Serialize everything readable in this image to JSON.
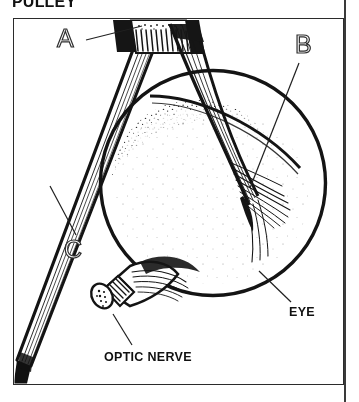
{
  "page": {
    "heading": "PULLEY",
    "width": 359,
    "height": 402,
    "background_color": "#ffffff",
    "ink_color": "#1a1a1a"
  },
  "figure": {
    "type": "anatomical-line-drawing",
    "frame": {
      "stroke_color": "#2b2b2b",
      "x": 13,
      "y": 18,
      "width": 331,
      "height": 367
    },
    "callout_labels": [
      {
        "id": "A",
        "text": "A",
        "style": "outline-letter",
        "x": 57,
        "y": 26,
        "leader_from": [
          88,
          41
        ],
        "leader_to": [
          140,
          28
        ],
        "points_to": "trochlea-pulley"
      },
      {
        "id": "B",
        "text": "B",
        "style": "outline-letter",
        "x": 295,
        "y": 32,
        "leader_from": [
          300,
          62
        ],
        "leader_to": [
          248,
          186
        ],
        "points_to": "tendon-insertion-fibers"
      },
      {
        "id": "C",
        "text": "C",
        "style": "outline-letter",
        "x": 64,
        "y": 237,
        "leader_from": [
          74,
          236
        ],
        "leader_to": [
          50,
          186
        ],
        "points_to": "superior-oblique-muscle-belly"
      }
    ],
    "text_labels": [
      {
        "id": "eye",
        "text": "EYE",
        "style": "bold-caption",
        "x": 289,
        "y": 305,
        "leader_from": [
          288,
          303
        ],
        "leader_to": [
          258,
          272
        ],
        "points_to": "eyeball-sclera"
      },
      {
        "id": "optic-nerve",
        "text": "OPTIC NERVE",
        "style": "bold-caption",
        "x": 104,
        "y": 350,
        "leader_from": [
          131,
          346
        ],
        "leader_to": [
          113,
          314
        ],
        "points_to": "optic-nerve-stump"
      }
    ],
    "parts": {
      "eyeball": {
        "name": "eyeball",
        "shape": "circle",
        "center_x": 213,
        "center_y": 183,
        "radius": 113,
        "shading": "stipple-rim-dark-center-light"
      },
      "trochlea": {
        "name": "trochlea-pulley",
        "description": "dark hatched band at top through which the tendon passes",
        "x": 112,
        "y": 20,
        "width": 78,
        "height": 34
      },
      "superior_oblique": {
        "name": "superior-oblique-muscle",
        "description": "long striated band running from upper right to lower left",
        "start": [
          140,
          30
        ],
        "end": [
          14,
          372
        ]
      },
      "tendon": {
        "name": "reflected-tendon",
        "description": "tendon sweeping from pulley down-right, fanning into fibers on the globe",
        "start": [
          168,
          24
        ],
        "end": [
          253,
          212
        ]
      },
      "optic_nerve": {
        "name": "optic-nerve",
        "description": "cut cylindrical stump at lower left of globe with hatched bands",
        "x": 86,
        "y": 258,
        "width": 96,
        "height": 62
      }
    }
  }
}
